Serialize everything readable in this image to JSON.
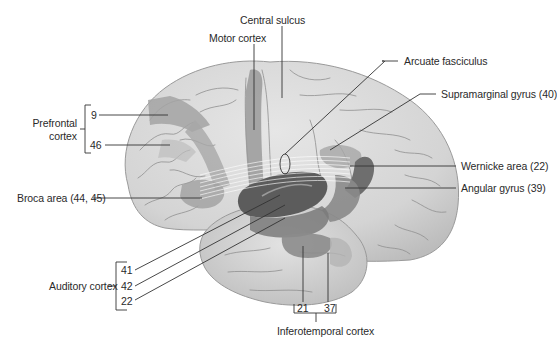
{
  "figure": {
    "colors": {
      "background": "#ffffff",
      "brain_surface": "#d9d9d9",
      "brain_shadow": "#b9b9b9",
      "sulci": "#8f8f8f",
      "region_light": "#a8a8a8",
      "region_mid": "#8c8c8c",
      "region_dark": "#6e6e6e",
      "leader_line": "#333333",
      "text": "#2a2a2a"
    }
  },
  "labels": {
    "central_sulcus": "Central sulcus",
    "motor_cortex": "Motor cortex",
    "arcuate_fasciculus": "Arcuate fasciculus",
    "supramarginal_gyrus": "Supramarginal gyrus (40)",
    "prefrontal_cortex_line1": "Prefrontal",
    "prefrontal_cortex_line2": "cortex",
    "area_9": "9",
    "area_46": "46",
    "wernicke_area": "Wernicke area (22)",
    "angular_gyrus": "Angular gyrus (39)",
    "broca_area": "Broca area (44, 45)",
    "auditory_cortex": "Auditory cortex",
    "area_41": "41",
    "area_42": "42",
    "area_22": "22",
    "area_21": "21",
    "area_37": "37",
    "inferotemporal_cortex": "Inferotemporal cortex"
  }
}
